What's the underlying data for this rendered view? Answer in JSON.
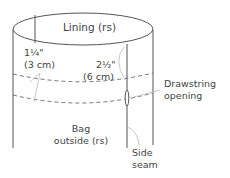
{
  "diagram": {
    "type": "sewing-illustration",
    "colors": {
      "line": "#555555",
      "leader": "#bbbbbb",
      "text": "#444444"
    },
    "labels": {
      "lining": "Lining (rs)",
      "seam_allowance_imperial": "1¼\"",
      "seam_allowance_metric": "(3 cm)",
      "casing_imperial": "2½\"",
      "casing_metric": "(6 cm)",
      "drawstring_line1": "Drawstring",
      "drawstring_line2": "opening",
      "bag_line1": "Bag",
      "bag_line2": "outside (rs)",
      "side_line1": "Side",
      "side_line2": "seam"
    }
  }
}
